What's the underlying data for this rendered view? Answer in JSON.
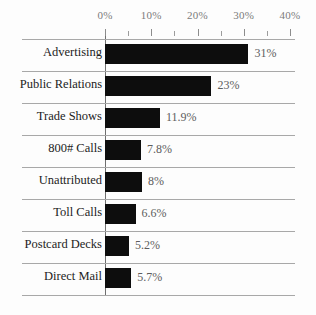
{
  "chart_data": {
    "type": "bar",
    "orientation": "horizontal",
    "title": "",
    "xlabel": "",
    "ylabel": "",
    "xlim": [
      0,
      40
    ],
    "grid": true,
    "legend": null,
    "axis": {
      "major_ticks": [
        0,
        10,
        20,
        30,
        40
      ],
      "major_tick_labels": [
        "0%",
        "10%",
        "20%",
        "30%",
        "40%"
      ],
      "minor_ticks": [
        5,
        15,
        25,
        35
      ]
    },
    "categories": [
      "Advertising",
      "Public Relations",
      "Trade Shows",
      "800# Calls",
      "Unattributed",
      "Toll Calls",
      "Postcard Decks",
      "Direct Mail"
    ],
    "values": [
      31,
      23,
      11.9,
      7.8,
      8,
      6.6,
      5.2,
      5.7
    ],
    "value_labels": [
      "31%",
      "23%",
      "11.9%",
      "7.8%",
      "8%",
      "6.6%",
      "5.2%",
      "5.7%"
    ],
    "colors": {
      "bar": "#0d0d0d",
      "grid_line": "#a8a8a8",
      "axis_line": "#6f6f6f",
      "tick_label": "#7b7b7b",
      "category_label": "#1c1c1c",
      "value_label": "#5d5d5d",
      "background": "#fdfdfd"
    }
  }
}
